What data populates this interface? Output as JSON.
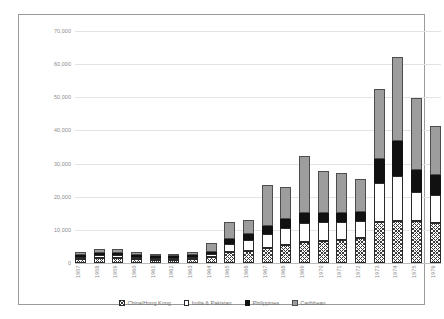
{
  "chart_data": {
    "type": "bar",
    "stacked": true,
    "title": "",
    "xlabel": "",
    "ylabel": "",
    "ylim": [
      0,
      70000
    ],
    "yticks": [
      "0",
      "10,000",
      "20,000",
      "30,000",
      "40,000",
      "50,000",
      "60,000",
      "70,000"
    ],
    "ytick_values": [
      0,
      10000,
      20000,
      30000,
      40000,
      50000,
      60000,
      70000
    ],
    "grid": true,
    "legend_position": "bottom",
    "categories": [
      "1957",
      "1958",
      "1959",
      "1960",
      "1961",
      "1962",
      "1963",
      "1964",
      "1965",
      "1966",
      "1967",
      "1968",
      "1969",
      "1970",
      "1971",
      "1972",
      "1973",
      "1974",
      "1975",
      "1976"
    ],
    "series": [
      {
        "name": "China/Hong Kong",
        "color": "#ffffff",
        "pattern": "cross-hatch",
        "values": [
          1200,
          1600,
          1600,
          1200,
          900,
          800,
          1100,
          1700,
          3200,
          3600,
          4400,
          5400,
          6400,
          6700,
          7000,
          7600,
          12400,
          12800,
          12600,
          12200
        ]
      },
      {
        "name": "India & Pakistan",
        "color": "#ffffff",
        "pattern": "solid-white",
        "values": [
          700,
          900,
          900,
          700,
          500,
          500,
          700,
          900,
          2600,
          3200,
          4400,
          5300,
          5800,
          5700,
          5400,
          5200,
          11800,
          13600,
          8800,
          8200
        ]
      },
      {
        "name": "Philippines",
        "color": "#111111",
        "pattern": "solid-black",
        "values": [
          400,
          500,
          500,
          400,
          300,
          300,
          400,
          600,
          1600,
          2000,
          2400,
          2700,
          2900,
          2800,
          2700,
          2700,
          7200,
          10500,
          6700,
          6100
        ]
      },
      {
        "name": "Caribbean",
        "color": "#9d9d9d",
        "pattern": "solid-gray",
        "values": [
          900,
          1100,
          1100,
          900,
          700,
          600,
          900,
          2800,
          5000,
          4200,
          12400,
          9400,
          17300,
          12600,
          12200,
          10000,
          21100,
          25300,
          21600,
          15000
        ]
      }
    ],
    "totals": [
      3200,
      4100,
      4100,
      3200,
      2400,
      2200,
      3100,
      6000,
      12400,
      13000,
      23600,
      22800,
      32400,
      27800,
      27300,
      25500,
      52500,
      62200,
      49700,
      41500
    ]
  },
  "legend": {
    "items": [
      {
        "label": "China/Hong Kong",
        "swatch": "china-swatch"
      },
      {
        "label": "India & Pakistan",
        "swatch": "india-swatch"
      },
      {
        "label": "Philippines",
        "swatch": "philippines-swatch"
      },
      {
        "label": "Caribbean",
        "swatch": "caribbean-swatch"
      }
    ]
  }
}
